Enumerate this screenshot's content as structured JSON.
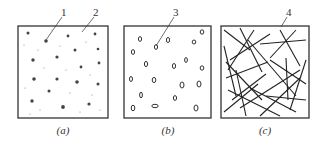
{
  "panels": [
    {
      "id": "a",
      "caption": "(a)",
      "labels": [
        "1",
        "2"
      ]
    },
    {
      "id": "b",
      "caption": "(b)",
      "labels": [
        "3"
      ]
    },
    {
      "id": "c",
      "caption": "(c)",
      "labels": [
        "4"
      ]
    }
  ],
  "colors": {
    "line": "#333333",
    "background": "#ffffff"
  }
}
